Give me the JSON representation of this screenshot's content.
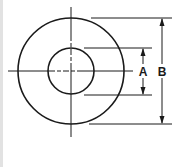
{
  "diagram": {
    "type": "washer-dimension-drawing",
    "colors": {
      "line": "#1a1a1a",
      "background": "#ffffff",
      "border": "#d8d8d8"
    },
    "center": {
      "x": 71,
      "y": 71
    },
    "outer_circle": {
      "r": 53
    },
    "inner_circle": {
      "r": 23
    },
    "dimensions": [
      {
        "label": "A",
        "describes": "inner diameter"
      },
      {
        "label": "B",
        "describes": "outer diameter"
      }
    ]
  }
}
